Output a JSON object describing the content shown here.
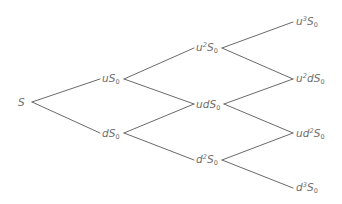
{
  "diagram": {
    "type": "binomial-tree",
    "steps": 3,
    "line_color": "#6a6a6a",
    "text_color": "#6e6e6e",
    "nodes": {
      "root": {
        "label": "S"
      },
      "u": {
        "pre": "u",
        "exp": "",
        "mid": "",
        "mexp": "",
        "base": "S",
        "sub": "0"
      },
      "d": {
        "pre": "d",
        "exp": "",
        "mid": "",
        "mexp": "",
        "base": "S",
        "sub": "0"
      },
      "uu": {
        "pre": "u",
        "exp": "2",
        "mid": "",
        "mexp": "",
        "base": "S",
        "sub": "0"
      },
      "ud": {
        "pre": "ud",
        "exp": "",
        "mid": "",
        "mexp": "",
        "base": "S",
        "sub": "0"
      },
      "dd": {
        "pre": "d",
        "exp": "2",
        "mid": "",
        "mexp": "",
        "base": "S",
        "sub": "0"
      },
      "uuu": {
        "pre": "u",
        "exp": "3",
        "mid": "",
        "mexp": "",
        "base": "S",
        "sub": "0"
      },
      "uud": {
        "pre": "u",
        "exp": "2",
        "mid": "d",
        "mexp": "",
        "base": "S",
        "sub": "0"
      },
      "udd": {
        "pre": "ud",
        "exp": "2",
        "mid": "",
        "mexp": "",
        "base": "S",
        "sub": "0"
      },
      "ddd": {
        "pre": "d",
        "exp": "3",
        "mid": "",
        "mexp": "",
        "base": "S",
        "sub": "0"
      }
    },
    "labels_text": [
      "S",
      "uS0",
      "dS0",
      "u2S0",
      "udS0",
      "d2S0",
      "u3S0",
      "u2dS0",
      "ud2S0",
      "d3S0"
    ]
  }
}
